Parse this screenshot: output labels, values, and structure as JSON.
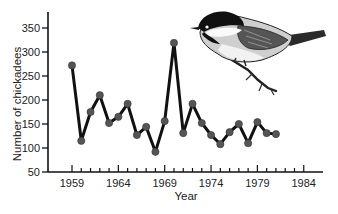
{
  "chart_data": {
    "type": "line",
    "title": "",
    "xlabel": "Year",
    "ylabel": "Number of chickadees",
    "x": [
      1959,
      1960,
      1961,
      1962,
      1963,
      1964,
      1965,
      1966,
      1967,
      1968,
      1969,
      1970,
      1971,
      1972,
      1973,
      1974,
      1975,
      1976,
      1977,
      1978,
      1979,
      1980,
      1981
    ],
    "series": [
      {
        "name": "Chickadees",
        "values": [
          272,
          115,
          175,
          210,
          152,
          165,
          192,
          127,
          144,
          92,
          156,
          319,
          131,
          192,
          152,
          127,
          108,
          133,
          150,
          110,
          154,
          131,
          129
        ]
      }
    ],
    "xlim": [
      1955,
      1987
    ],
    "ylim": [
      50,
      380
    ],
    "x_ticks": [
      "1959",
      "1964",
      "1969",
      "1974",
      "1979",
      "1984"
    ],
    "y_ticks": [
      "50",
      "100",
      "150",
      "200",
      "250",
      "300",
      "350"
    ],
    "grid": false,
    "legend": "none",
    "annotations": [
      "illustration of a black-capped chickadee perched on a branch (upper right)"
    ],
    "line_color": "#111111",
    "marker_color": "#555555"
  }
}
